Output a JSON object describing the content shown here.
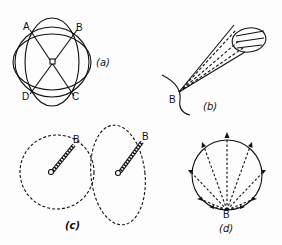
{
  "figure": {
    "panels": [
      {
        "id": "a",
        "caption": "(a)",
        "points": [
          "A",
          "B",
          "C",
          "D"
        ]
      },
      {
        "id": "b",
        "caption": "(b)",
        "point": "B"
      },
      {
        "id": "c",
        "caption": "(c)",
        "points": [
          "B",
          "B"
        ]
      },
      {
        "id": "d",
        "caption": "(d)",
        "point": "B"
      }
    ]
  },
  "colors": {
    "ink": "#111111",
    "background": "#fdfdfd"
  }
}
